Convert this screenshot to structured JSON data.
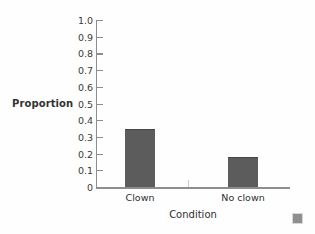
{
  "chart_data": {
    "type": "bar",
    "title": "",
    "subtitle": "",
    "xlabel": "Condition",
    "ylabel": "Proportion",
    "categories": [
      "Clown",
      "No clown"
    ],
    "values": [
      0.35,
      0.18
    ],
    "series": [
      {
        "name": "Proportion",
        "values": [
          0.35,
          0.18
        ]
      }
    ],
    "ylim": [
      0,
      1.0
    ],
    "ytick_step": 0.1,
    "ytick_labels": [
      "0",
      "0.1",
      "0.2",
      "0.3",
      "0.4",
      "0.5",
      "0.6",
      "0.7",
      "0.8",
      "0.9",
      "1.0"
    ],
    "ytick_values": [
      0,
      0.1,
      0.2,
      0.3,
      0.4,
      0.5,
      0.6,
      0.7,
      0.8,
      0.9,
      1.0
    ],
    "grid": false,
    "legend": false,
    "legend_position": "none",
    "annotations": [],
    "bar_color": "#5c5c5c",
    "axis_color": "#8d8d8d",
    "background_color": "#fefefe",
    "text_color": "#2f2f2f"
  },
  "axes": {
    "y_label": "Proportion",
    "x_label": "Condition",
    "ticks": [
      {
        "label": "1.0",
        "value": 1.0
      },
      {
        "label": "0.9",
        "value": 0.9
      },
      {
        "label": "0.8",
        "value": 0.8
      },
      {
        "label": "0.7",
        "value": 0.7
      },
      {
        "label": "0.6",
        "value": 0.6
      },
      {
        "label": "0.5",
        "value": 0.5
      },
      {
        "label": "0.4",
        "value": 0.4
      },
      {
        "label": "0.3",
        "value": 0.3
      },
      {
        "label": "0.2",
        "value": 0.2
      },
      {
        "label": "0.1",
        "value": 0.1
      },
      {
        "label": "0",
        "value": 0
      }
    ]
  },
  "bars": [
    {
      "category": "Clown",
      "value": 0.35
    },
    {
      "category": "No clown",
      "value": 0.18
    }
  ]
}
